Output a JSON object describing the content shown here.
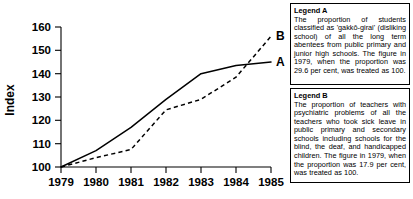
{
  "chart_data": {
    "type": "line",
    "title": "",
    "xlabel": "",
    "ylabel": "Index",
    "x": [
      "1979",
      "1980",
      "1981",
      "1982",
      "1983",
      "1984",
      "1985"
    ],
    "xlim": [
      1979,
      1985
    ],
    "ylim": [
      100,
      160
    ],
    "yticks": [
      100,
      110,
      120,
      130,
      140,
      150,
      160
    ],
    "grid": false,
    "legend_position": "right",
    "series": [
      {
        "name": "A",
        "style": "solid",
        "end_label": "A",
        "values": [
          100,
          107,
          117,
          129,
          140,
          143.5,
          145
        ]
      },
      {
        "name": "B",
        "style": "dashed",
        "end_label": "B",
        "values": [
          100,
          104,
          107.5,
          124.5,
          129,
          138.5,
          156
        ]
      }
    ]
  },
  "legends": [
    {
      "title": "Legend A",
      "body": "The proportion of students classified as 'gakkō-girai' (disliking school) of all the long term abentees from public primary and junior high schools. The figure in 1979, when the proportion was 29.6 per cent, was treated as 100."
    },
    {
      "title": "Legend B",
      "body": "The proportion of teachers with psychiatric problems of all the teachers who took sick leave in public primary and secondary schools including schools for the blind, the deaf, and handicapped children. The figure in 1979, when the proportion was 17.9 per cent, was treated as 100."
    }
  ]
}
